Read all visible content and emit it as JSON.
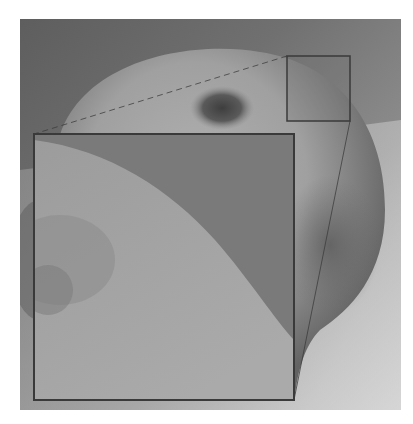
{
  "figure": {
    "palette": {
      "background_dark": "#6a6a6a",
      "background_mid": "#8a8a8a",
      "background_light": "#c8c8c8",
      "apple_light": "#a8a8a8",
      "apple_shadow": "#6e6e6e",
      "stem_cavity": "#4a4a4a",
      "inset_bg": "#7c7c7c",
      "inset_apple": "#a2a2a2",
      "box_stroke": "#3a3a3a"
    },
    "photo_region": {
      "x": 20,
      "y": 19,
      "w": 381,
      "h": 391
    },
    "zoom_source_box": {
      "x": 287,
      "y": 56,
      "w": 63,
      "h": 65
    },
    "zoom_inset_box": {
      "x": 34,
      "y": 134,
      "w": 260,
      "h": 266
    }
  }
}
